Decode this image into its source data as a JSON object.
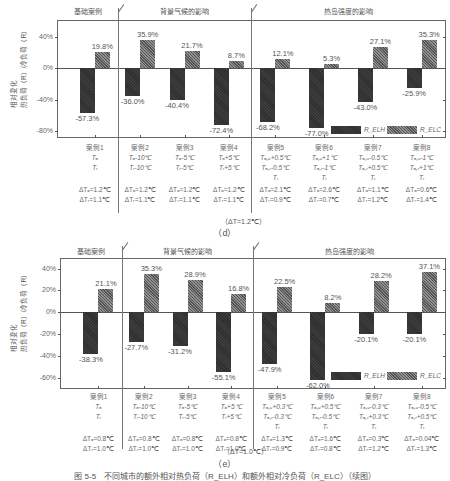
{
  "chart_data": [
    {
      "id": "d",
      "type": "bar",
      "caption": "（d）",
      "ylabel": "相对变化\n热负荷（R_ELH）/冷负荷（R_ELC）",
      "yticks": [
        "40%",
        "0%",
        "-40%",
        "-80%"
      ],
      "ylim": [
        -100,
        50
      ],
      "groups": [
        "基础案例",
        "背景气候的影响",
        "热岛强度的影响"
      ],
      "categories": [
        "案例1",
        "案例2",
        "案例3",
        "案例4",
        "案例5",
        "案例6",
        "案例7",
        "案例8"
      ],
      "series": [
        {
          "name": "R_ELH",
          "values": [
            -57.3,
            -36.0,
            -40.4,
            -72.4,
            -68.2,
            -77.0,
            -43.0,
            -25.9
          ]
        },
        {
          "name": "R_ELC",
          "values": [
            19.8,
            35.9,
            21.7,
            8.7,
            12.1,
            5.3,
            27.1,
            35.3
          ]
        }
      ],
      "labels_neg": [
        "-57.3%",
        "-36.0%",
        "-40.4%",
        "-72.4%",
        "-68.2%",
        "-77.0%",
        "-43.0%",
        "-25.9%"
      ],
      "labels_pos": [
        "19.8%",
        "35.9%",
        "21.7%",
        "8.7%",
        "12.1%",
        "5.3%",
        "27.1%",
        "35.3%"
      ],
      "case_rows": [
        [
          "案例1",
          "Tₐ",
          "Tᵣ",
          "",
          "ΔTₐ=1.2℃",
          "ΔTᵣ=1.1℃"
        ],
        [
          "案例2",
          "Tₐ-10℃",
          "Tᵣ-10℃",
          "",
          "ΔTₐ=1.2℃",
          "ΔTᵣ=1.1℃"
        ],
        [
          "案例3",
          "Tₐ-5℃",
          "Tᵣ-5℃",
          "",
          "ΔTₐ=1.2℃",
          "ΔTᵣ=1.1℃"
        ],
        [
          "案例4",
          "Tₐ+5℃",
          "Tᵣ+5℃",
          "",
          "ΔTₐ=1.2℃",
          "ΔTᵣ=1.1℃"
        ],
        [
          "案例5",
          "Tₐ,ᵤ+0.5℃",
          "Tₐ,ᵣ-0.5℃",
          "Tᵣ",
          "ΔTₐ=2.1℃",
          "ΔTᵣ=0.9℃"
        ],
        [
          "案例6",
          "Tₐ,ᵤ+1℃",
          "Tₐ,ᵣ-1℃",
          "Tᵣ",
          "ΔTₐ=2.6℃",
          "ΔTᵣ=0.7℃"
        ],
        [
          "案例7",
          "Tₐ,ᵤ-0.5℃",
          "Tₐ,ᵣ+0.5℃",
          "Tᵣ",
          "ΔTₐ=1.1℃",
          "ΔTᵣ=1.2℃"
        ],
        [
          "案例8",
          "Tₐ,ᵤ-1℃",
          "Tₐ,ᵣ+1℃",
          "Tᵣ",
          "ΔTₐ=0.6℃",
          "ΔTᵣ=1.4℃"
        ]
      ],
      "delta_note": "（ΔT=1.2℃）",
      "legend": [
        "R_ELH",
        "R_ELC"
      ]
    },
    {
      "id": "e",
      "type": "bar",
      "caption": "（e）",
      "ylabel": "相对变化\n热负荷（R_ELH）/冷负荷（R_ELC）",
      "yticks": [
        "40%",
        "20%",
        "0%",
        "-20%",
        "-40%",
        "-60%"
      ],
      "ylim": [
        -70,
        50
      ],
      "groups": [
        "基础案例",
        "背景气候的影响",
        "热岛强度的影响"
      ],
      "categories": [
        "案例1",
        "案例2",
        "案例3",
        "案例4",
        "案例5",
        "案例6",
        "案例7",
        "案例8"
      ],
      "series": [
        {
          "name": "R_ELH",
          "values": [
            -38.3,
            -27.7,
            -31.2,
            -55.1,
            -47.9,
            -62.0,
            -20.1,
            -20.1
          ]
        },
        {
          "name": "R_ELC",
          "values": [
            21.1,
            35.3,
            28.9,
            16.8,
            22.5,
            8.2,
            28.2,
            37.1
          ]
        }
      ],
      "labels_neg": [
        "-38.3%",
        "-27.7%",
        "-31.2%",
        "-55.1%",
        "-47.9%",
        "-62.0%",
        "-20.1%",
        "-20.1%"
      ],
      "labels_pos": [
        "21.1%",
        "35.3%",
        "28.9%",
        "16.8%",
        "22.5%",
        "8.2%",
        "28.2%",
        "37.1%"
      ],
      "case_rows": [
        [
          "案例1",
          "Tₐ",
          "Tᵣ",
          "",
          "ΔTₐ=0.8℃",
          "ΔTᵣ=1.0℃"
        ],
        [
          "案例2",
          "Tₐ-10℃",
          "Tᵣ-10℃",
          "",
          "ΔTₐ=0.8℃",
          "ΔTᵣ=1.0℃"
        ],
        [
          "案例3",
          "Tₐ-5℃",
          "Tᵣ-5℃",
          "",
          "ΔTₐ=0.8℃",
          "ΔTᵣ=1.0℃"
        ],
        [
          "案例4",
          "Tₐ+5℃",
          "Tᵣ+5℃",
          "",
          "ΔTₐ=0.8℃",
          "ΔTᵣ=1.0℃"
        ],
        [
          "案例5",
          "Tₐ,ᵤ+0.3℃",
          "Tₐ,ᵣ-0.3℃",
          "Tᵣ",
          "ΔTₐ=1.3℃",
          "ΔTᵣ=0.9℃"
        ],
        [
          "案例6",
          "Tₐ,ᵤ+0.5℃",
          "Tₐ,ᵣ-0.5℃",
          "Tᵣ",
          "ΔTₐ=1.6℃",
          "ΔTᵣ=0.8℃"
        ],
        [
          "案例7",
          "Tₐ,ᵤ-0.3℃",
          "Tₐ,ᵣ+0.3℃",
          "Tᵣ",
          "ΔTₐ=0.3℃",
          "ΔTᵣ=1.2℃"
        ],
        [
          "案例8",
          "Tₐ,ᵤ-0.5℃",
          "Tₐ,ᵣ+0.5℃",
          "Tᵣ",
          "ΔTₐ=0.04℃",
          "ΔTᵣ=1.3℃"
        ]
      ],
      "delta_note": "（ΔT=1.0℃）",
      "legend": [
        "R_ELH",
        "R_ELC"
      ]
    }
  ],
  "figure_caption": "图 5-5　不同城市的额外相对热负荷（R_ELH）和额外相对冷负荷（R_ELC）（续图）"
}
